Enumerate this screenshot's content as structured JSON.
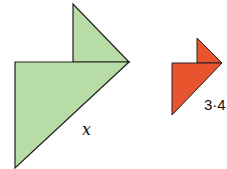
{
  "figure": {
    "shapes": [
      {
        "name": "green-large-triangle",
        "color": "#b8dca6",
        "stroke": "#222222"
      },
      {
        "name": "green-small-triangle",
        "color": "#b8dca6",
        "stroke": "#222222"
      },
      {
        "name": "orange-large-triangle",
        "color": "#e8542e",
        "stroke": "#222222"
      },
      {
        "name": "orange-small-triangle",
        "color": "#e8542e",
        "stroke": "#222222"
      }
    ],
    "labels": {
      "green_side": "x",
      "orange_side": "3·4"
    }
  }
}
